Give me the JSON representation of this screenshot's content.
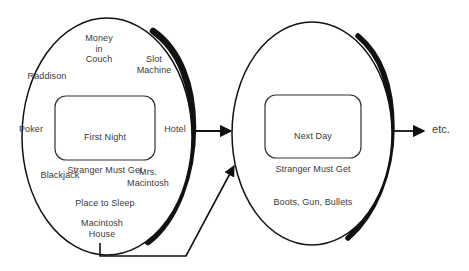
{
  "diagram": {
    "background_color": "#ffffff",
    "stroke_color": "#111111",
    "text_color": "#3a3a3a",
    "stages": [
      {
        "id": "stage-1",
        "core_label": "First Night\nStranger Must Get\nPlace to Sleep",
        "core_line_1": "First Night",
        "core_line_2": "Stranger Must Get",
        "core_line_3": "Place to Sleep",
        "satellites": [
          {
            "id": "money-in-couch",
            "label": "Money\nin\nCouch"
          },
          {
            "id": "slot-machine",
            "label": "Slot\nMachine"
          },
          {
            "id": "raddison",
            "label": "Raddison"
          },
          {
            "id": "poker",
            "label": "Poker"
          },
          {
            "id": "hotel",
            "label": "Hotel"
          },
          {
            "id": "blackjack",
            "label": "Blackjack"
          },
          {
            "id": "mrs-macintosh",
            "label": "Mrs.\nMacintosh"
          },
          {
            "id": "macintosh-house",
            "label": "Macintosh\nHouse"
          }
        ]
      },
      {
        "id": "stage-2",
        "core_label": "Next Day\nStranger Must Get\nBoots, Gun, Bullets",
        "core_line_1": "Next Day",
        "core_line_2": "Stranger Must Get",
        "core_line_3": "Boots, Gun, Bullets",
        "satellites": []
      }
    ],
    "continuation_label": "etc.",
    "connectors": [
      {
        "id": "stage1-to-stage2",
        "kind": "arrow-right"
      },
      {
        "id": "stage2-to-etc",
        "kind": "arrow-right"
      },
      {
        "id": "feedback-loop",
        "kind": "elbow-arrow"
      }
    ]
  }
}
